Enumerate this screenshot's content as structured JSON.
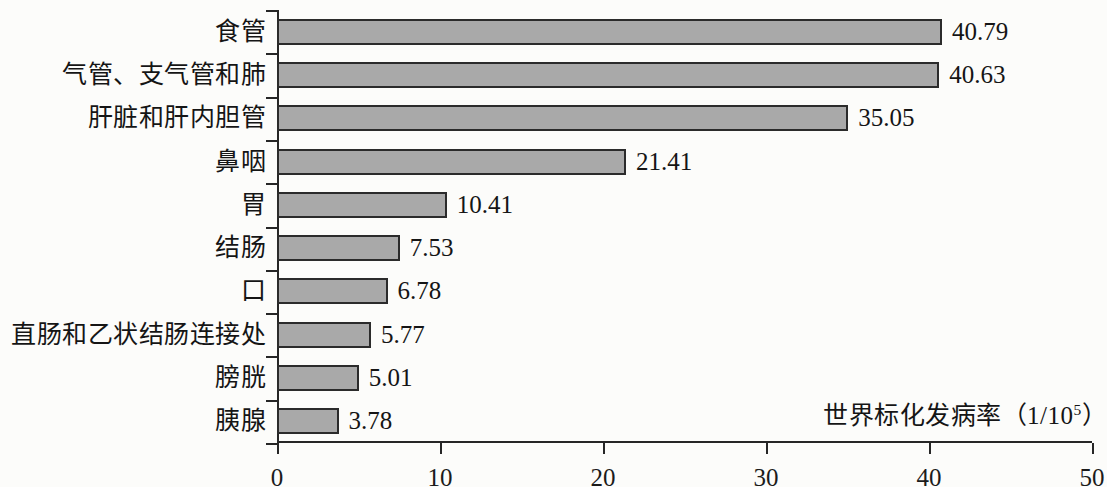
{
  "chart_data": {
    "type": "bar",
    "orientation": "horizontal",
    "title": "",
    "xlabel": "世界标化发病率（1/10⁵）",
    "ylabel": "",
    "xlim": [
      0,
      50
    ],
    "xticks": [
      "0",
      "10",
      "20",
      "30",
      "40",
      "50"
    ],
    "xtick_values": [
      0,
      10,
      20,
      30,
      40,
      50
    ],
    "grid": false,
    "legend": false,
    "categories": [
      "食管",
      "气管、支气管和肺",
      "肝脏和肝内胆管",
      "鼻咽",
      "胃",
      "结肠",
      "口",
      "直肠和乙状结肠连接处",
      "膀胱",
      "胰腺"
    ],
    "values": [
      40.79,
      40.63,
      35.05,
      21.41,
      10.41,
      7.53,
      6.78,
      5.77,
      5.01,
      3.78
    ],
    "value_labels": [
      "40.79",
      "40.63",
      "35.05",
      "21.41",
      "10.41",
      "7.53",
      "6.78",
      "5.77",
      "5.01",
      "3.78"
    ],
    "bar_fill_color": "#a9a9a9",
    "bar_border_color": "#2b2b2b",
    "axis_color": "#262626",
    "background_color": "#fcfcfa"
  },
  "axis_title": {
    "text_main": "世界标化发病率（1/10",
    "sup": "5",
    "text_tail": "）"
  }
}
